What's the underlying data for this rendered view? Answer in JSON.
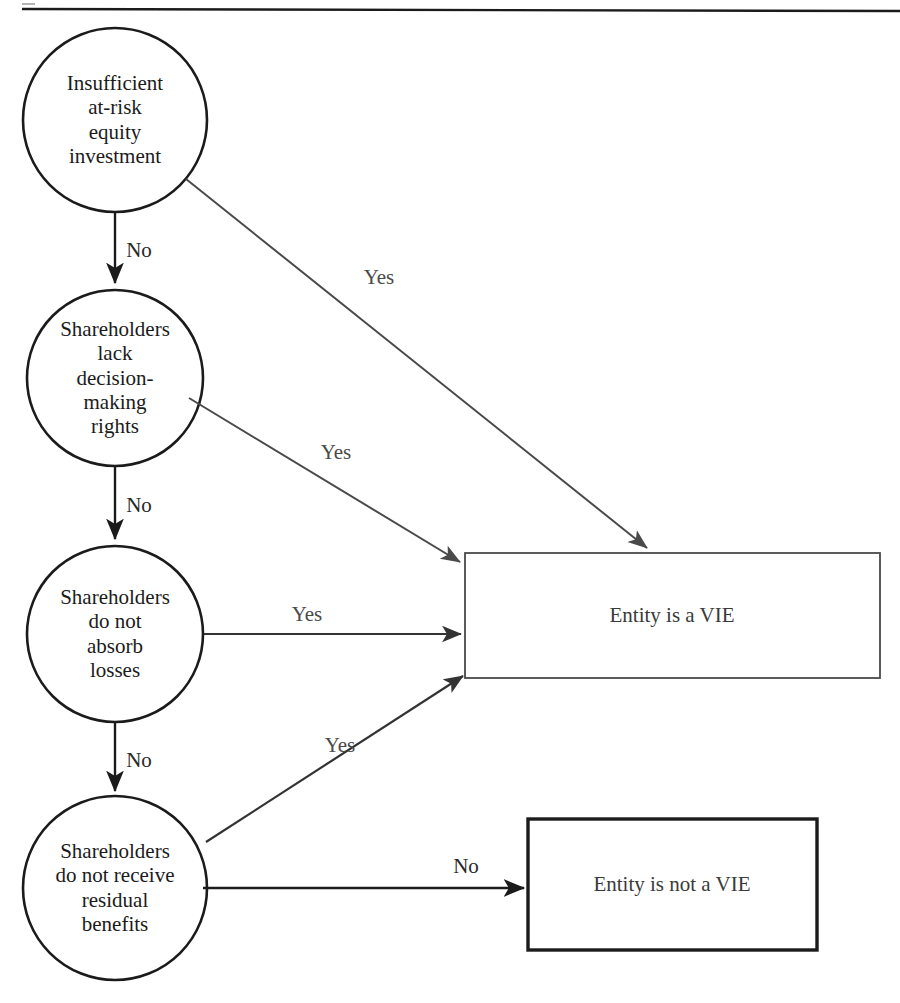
{
  "figure": {
    "background_color": "#ffffff",
    "stroke_color": "#1b1b1b",
    "thin_stroke_color": "#4a4a4a",
    "text_color": "#1b1b1b"
  },
  "decision_nodes": [
    {
      "id": "insufficient-equity",
      "label": "Insufficient\nat-risk\nequity\ninvestment",
      "cx": 115,
      "cy": 120,
      "r": 92
    },
    {
      "id": "no-decision-rights",
      "label": "Shareholders\nlack\ndecision-\nmaking\nrights",
      "cx": 115,
      "cy": 378,
      "r": 88
    },
    {
      "id": "no-absorb-losses",
      "label": "Shareholders\ndo not\nabsorb\nlosses",
      "cx": 115,
      "cy": 634,
      "r": 88
    },
    {
      "id": "no-residual-benefits",
      "label": "Shareholders\ndo not receive\nresidual\nbenefits",
      "cx": 115,
      "cy": 888,
      "r": 92
    }
  ],
  "outcome_boxes": [
    {
      "id": "entity-is-vie",
      "label": "Entity is a VIE",
      "x": 465,
      "y": 553,
      "w": 415,
      "h": 125,
      "border_width": 1.5
    },
    {
      "id": "entity-is-not-vie",
      "label": "Entity is not a VIE",
      "x": 528,
      "y": 819,
      "w": 289,
      "h": 131,
      "border_width": 3
    }
  ],
  "edges": [
    {
      "id": "edge-1-no",
      "label": "No",
      "label_x": 139,
      "label_y": 250,
      "kind": "vertical"
    },
    {
      "id": "edge-2-no",
      "label": "No",
      "label_x": 139,
      "label_y": 505,
      "kind": "vertical"
    },
    {
      "id": "edge-3-no",
      "label": "No",
      "label_x": 139,
      "label_y": 760,
      "kind": "vertical"
    },
    {
      "id": "edge-1-yes",
      "label": "Yes",
      "label_x": 379,
      "label_y": 277,
      "kind": "diagonal"
    },
    {
      "id": "edge-2-yes",
      "label": "Yes",
      "label_x": 336,
      "label_y": 452,
      "kind": "diagonal"
    },
    {
      "id": "edge-3-yes",
      "label": "Yes",
      "label_x": 307,
      "label_y": 614,
      "kind": "horizontal"
    },
    {
      "id": "edge-4-yes",
      "label": "Yes",
      "label_x": 340,
      "label_y": 745,
      "kind": "diagonal"
    },
    {
      "id": "edge-4-no",
      "label": "No",
      "label_x": 466,
      "label_y": 866,
      "kind": "horizontal"
    }
  ]
}
